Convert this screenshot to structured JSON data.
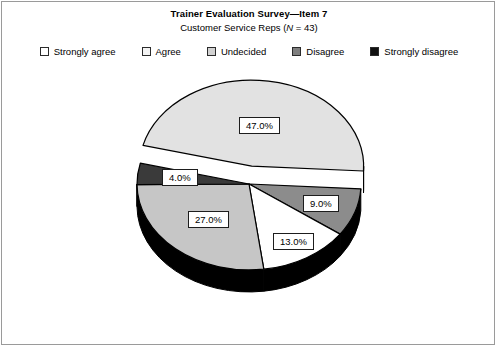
{
  "header": {
    "title": "Trainer Evaluation Survey—Item 7",
    "subtitle_prefix": "Customer Service Reps (",
    "subtitle_italic": "N",
    "subtitle_suffix": " = 43)"
  },
  "legend": {
    "items": [
      {
        "label": "Strongly agree",
        "color": "#ffffff",
        "swatch_name": "legend-swatch-strongly-agree"
      },
      {
        "label": "Agree",
        "color": "#f3f3f3",
        "swatch_name": "legend-swatch-agree"
      },
      {
        "label": "Undecided",
        "color": "#d2d2d2",
        "swatch_name": "legend-swatch-undecided"
      },
      {
        "label": "Disagree",
        "color": "#7f7f7f",
        "swatch_name": "legend-swatch-disagree"
      },
      {
        "label": "Strongly disagree",
        "color": "#111111",
        "swatch_name": "legend-swatch-strongly-disagree"
      }
    ]
  },
  "labels": {
    "v0": "47.0%",
    "v1": "9.0%",
    "v2": "13.0%",
    "v3": "27.0%",
    "v4": "4.0%"
  },
  "chart_data": {
    "type": "pie",
    "title": "Trainer Evaluation Survey—Item 7",
    "subtitle": "Customer Service Reps (N = 43)",
    "n": 43,
    "exploded": true,
    "three_d": true,
    "legend_position": "top",
    "categories": [
      "Strongly agree",
      "Agree",
      "Undecided",
      "Disagree",
      "Strongly disagree"
    ],
    "values": [
      47.0,
      9.0,
      13.0,
      27.0,
      4.0
    ],
    "value_labels": [
      "47.0%",
      "9.0%",
      "13.0%",
      "27.0%",
      "4.0%"
    ],
    "slice_colors": [
      "#e2e2e2",
      "#8c8c8c",
      "#ffffff",
      "#c6c6c6",
      "#3a3a3a"
    ],
    "slice_render_order": [
      {
        "name": "Strongly agree",
        "percent": 47.0,
        "fill": "#e2e2e2",
        "exploded": true,
        "label": "47.0%"
      },
      {
        "name": "Disagree",
        "percent": 9.0,
        "fill": "#8c8c8c",
        "exploded": false,
        "label": "9.0%"
      },
      {
        "name": "Agree",
        "percent": 13.0,
        "fill": "#ffffff",
        "exploded": false,
        "label": "13.0%"
      },
      {
        "name": "Undecided",
        "percent": 27.0,
        "fill": "#c6c6c6",
        "exploded": false,
        "label": "27.0%"
      },
      {
        "name": "Strongly disagree",
        "percent": 4.0,
        "fill": "#3a3a3a",
        "exploded": false,
        "label": "4.0%"
      }
    ],
    "side_wall_color": "#000000",
    "grid": false
  }
}
